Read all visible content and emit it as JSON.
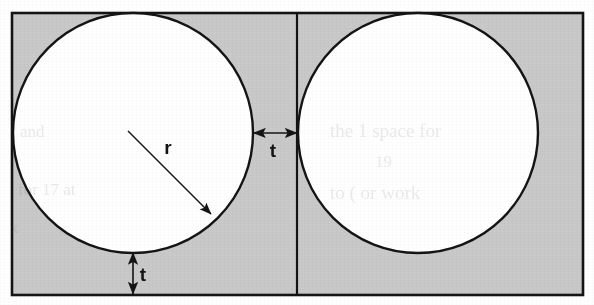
{
  "figure": {
    "background_color": "#ffffff",
    "fill_color": "#c9c9c9",
    "stroke_color": "#141414",
    "circle_fill_color": "#ffffff",
    "outer_rect": {
      "x": 12,
      "y": 13,
      "width": 571,
      "height": 282,
      "stroke_width": 2.6
    },
    "divider": {
      "x": 297,
      "y_top": 13,
      "y_bottom": 295,
      "stroke_width": 2.2
    },
    "circles": [
      {
        "name": "left-circle",
        "cx": 133,
        "cy": 133,
        "r": 120,
        "stroke_width": 2.4
      },
      {
        "name": "right-circle",
        "cx": 418,
        "cy": 133,
        "r": 120,
        "stroke_width": 2.4
      }
    ],
    "annotations": [
      {
        "name": "radius-annotation",
        "label": "r",
        "kind": "single-arrow",
        "from": {
          "x": 128,
          "y": 131
        },
        "to": {
          "x": 211,
          "y": 214
        },
        "label_x": 168,
        "label_y": 154,
        "font_size": 19,
        "stroke_width": 1.5
      },
      {
        "name": "horizontal-gap-annotation",
        "label": "t",
        "kind": "double-arrow-horizontal",
        "from": {
          "x": 254,
          "y": 133
        },
        "to": {
          "x": 297,
          "y": 133
        },
        "label_x": 273,
        "label_y": 157,
        "font_size": 19,
        "stroke_width": 1.6
      },
      {
        "name": "vertical-gap-annotation",
        "label": "t",
        "kind": "double-arrow-vertical",
        "from": {
          "x": 133,
          "y": 253
        },
        "to": {
          "x": 133,
          "y": 294
        },
        "label_x": 143,
        "label_y": 281,
        "font_size": 19,
        "stroke_width": 1.6
      }
    ],
    "ghost_show_through": [
      {
        "text": "the  1  space  for",
        "x": 330,
        "y": 120,
        "size": 19
      },
      {
        "text": "19",
        "x": 375,
        "y": 152,
        "size": 17
      },
      {
        "text": "to   (  or  work",
        "x": 330,
        "y": 182,
        "size": 19
      },
      {
        "text": "and",
        "x": 20,
        "y": 122,
        "size": 17
      },
      {
        "text": "for 17 at",
        "x": 18,
        "y": 180,
        "size": 17
      },
      {
        "text": "x",
        "x": 10,
        "y": 218,
        "size": 17
      }
    ]
  }
}
